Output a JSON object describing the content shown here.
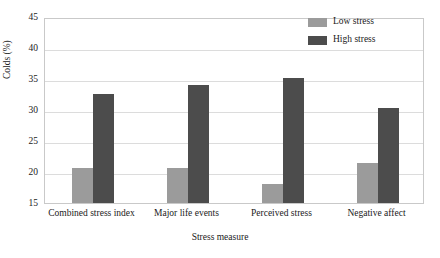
{
  "chart_data": {
    "type": "bar",
    "title": "",
    "subtitle": "",
    "xlabel": "Stress measure",
    "ylabel": "Colds (%)",
    "categories": [
      "Combined stress index",
      "Major life events",
      "Perceived stress",
      "Negative affect"
    ],
    "series": [
      {
        "name": "Low stress",
        "color": "#9b9b9b",
        "values": [
          20.6,
          20.7,
          18.1,
          21.5
        ]
      },
      {
        "name": "High stress",
        "color": "#4c4c4c",
        "values": [
          32.5,
          34.1,
          35.2,
          30.3
        ]
      }
    ],
    "ylim": [
      15,
      45
    ],
    "yticks": [
      15,
      20,
      25,
      30,
      35,
      40,
      45
    ],
    "ytick_labels": [
      "15",
      "20",
      "25",
      "30",
      "35",
      "40",
      "45"
    ],
    "grid": true,
    "grid_axis": "y",
    "legend_position": "top-right-inside",
    "bar_group_count": 4,
    "bars_per_group": 2
  },
  "axes": {
    "y_label": "Colds (%)",
    "x_label": "Stress measure",
    "y_ticks": [
      "45",
      "40",
      "35",
      "30",
      "25",
      "20",
      "15"
    ]
  },
  "legend": {
    "items": [
      {
        "label": "Low stress",
        "color": "#9b9b9b"
      },
      {
        "label": "High stress",
        "color": "#4c4c4c"
      }
    ]
  },
  "x_labels": [
    "Combined stress index",
    "Major life events",
    "Perceived stress",
    "Negative affect"
  ],
  "colors": {
    "low_stress": "#9b9b9b",
    "high_stress": "#4c4c4c",
    "grid": "#dcdcdc",
    "frame": "#c9c9c9",
    "background": "#ffffff",
    "text": "#1a1a1a"
  }
}
